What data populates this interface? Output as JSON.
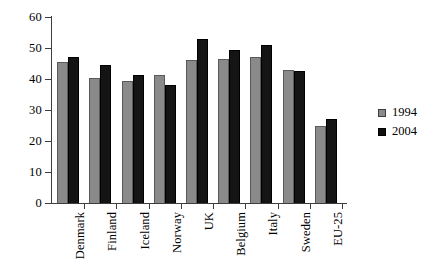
{
  "chart_data": {
    "type": "bar",
    "title": "",
    "subtitle": "",
    "xlabel": "",
    "ylabel": "",
    "categories": [
      "Denmark",
      "Finland",
      "Iceland",
      "Norway",
      "UK",
      "Belgium",
      "Italy",
      "Sweden",
      "EU-25"
    ],
    "series": [
      {
        "name": "1994",
        "color": "#8a8a8a",
        "values": [
          45.5,
          40.3,
          39.3,
          41.3,
          46.0,
          46.5,
          47.0,
          43.0,
          24.8
        ]
      },
      {
        "name": "2004",
        "color": "#141414",
        "values": [
          47.0,
          44.5,
          41.2,
          38.0,
          53.0,
          49.5,
          51.0,
          42.7,
          27.0
        ]
      }
    ],
    "ylim": [
      0,
      60
    ],
    "ytick_labels": [
      "0",
      "10",
      "20",
      "30",
      "40",
      "50",
      "60"
    ],
    "ytick_values": [
      0,
      10,
      20,
      30,
      40,
      50,
      60
    ],
    "grid": false,
    "legend_position": "right",
    "legend_entries": [
      "1994",
      "2004"
    ]
  }
}
